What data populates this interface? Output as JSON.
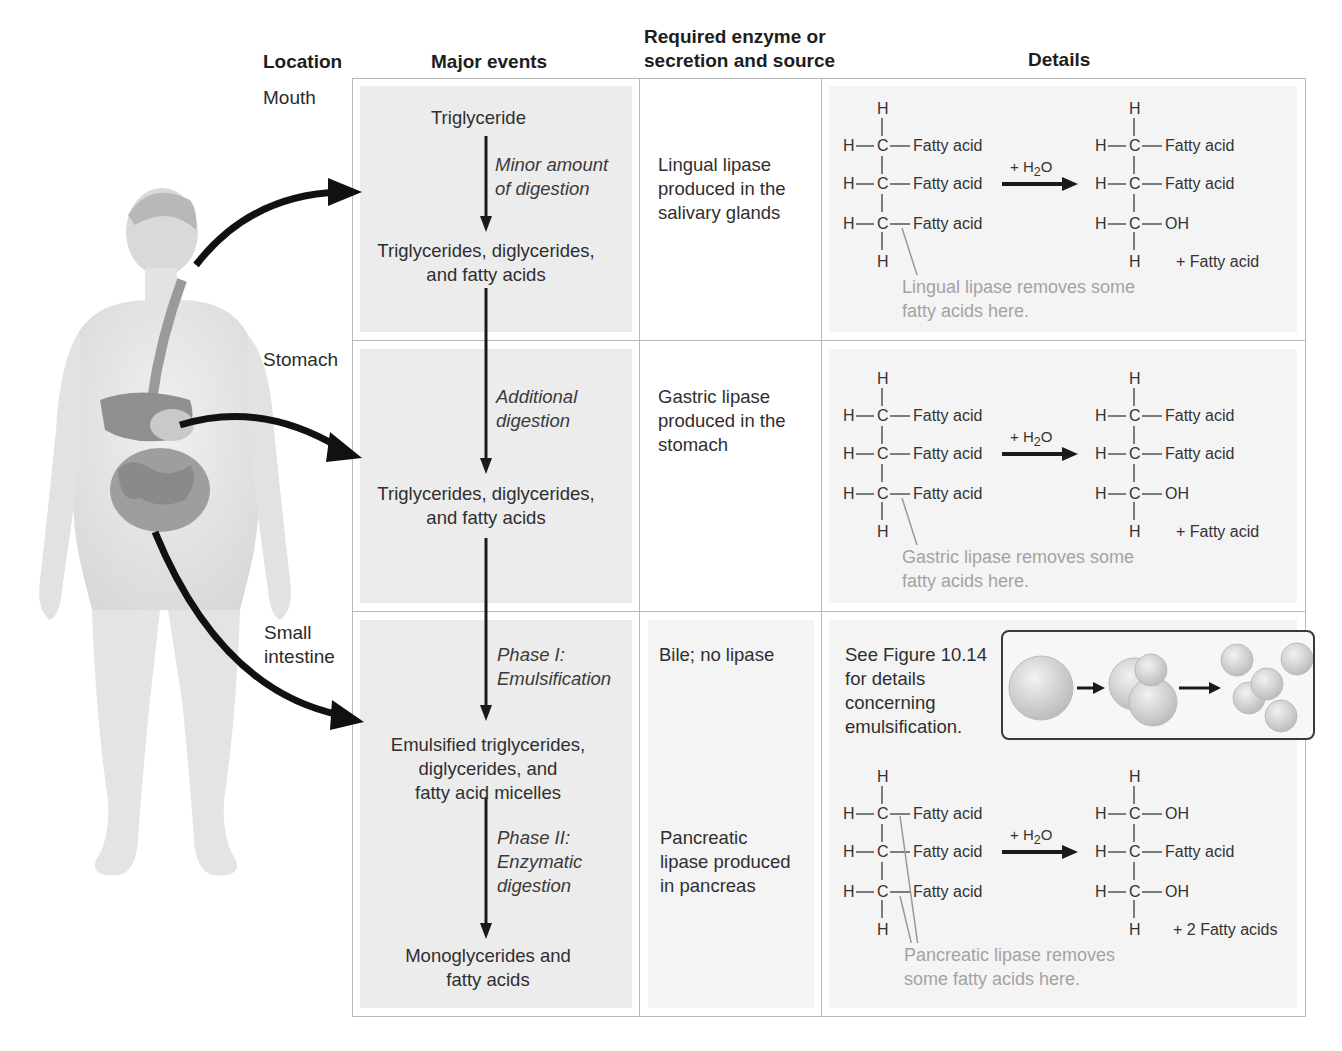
{
  "figure": {
    "headers": {
      "location": "Location",
      "major_events": "Major events",
      "enzyme_line1": "Required enzyme or",
      "enzyme_line2": "secretion and source",
      "details": "Details"
    },
    "rows": [
      {
        "location": "Mouth",
        "events": {
          "start": "Triglyceride",
          "process_line1": "Minor amount",
          "process_line2": "of digestion",
          "result_line1": "Triglycerides, diglycerides,",
          "result_line2": "and fatty acids"
        },
        "enzyme": [
          "Lingual lipase",
          "produced in the",
          "salivary glands"
        ],
        "reaction": {
          "reactant": [
            "Fatty acid",
            "Fatty acid",
            "Fatty acid"
          ],
          "reagent": "+ H",
          "reagent_sub": "2",
          "reagent_tail": "O",
          "product": [
            "Fatty acid",
            "Fatty acid",
            "OH"
          ],
          "byproduct": "+ Fatty acid",
          "note": [
            "Lingual lipase removes some",
            "fatty acids here."
          ]
        }
      },
      {
        "location": "Stomach",
        "events": {
          "process_line1": "Additional",
          "process_line2": "digestion",
          "result_line1": "Triglycerides, diglycerides,",
          "result_line2": "and fatty acids"
        },
        "enzyme": [
          "Gastric lipase",
          "produced in the",
          "stomach"
        ],
        "reaction": {
          "reactant": [
            "Fatty acid",
            "Fatty acid",
            "Fatty acid"
          ],
          "reagent": "+ H",
          "reagent_sub": "2",
          "reagent_tail": "O",
          "product": [
            "Fatty acid",
            "Fatty acid",
            "OH"
          ],
          "byproduct": "+ Fatty acid",
          "note": [
            "Gastric lipase removes some",
            "fatty acids here."
          ]
        }
      },
      {
        "location_line1": "Small",
        "location_line2": "intestine",
        "events": {
          "phase1_line1": "Phase I:",
          "phase1_line2": "Emulsification",
          "mid_line1": "Emulsified triglycerides,",
          "mid_line2": "diglycerides, and",
          "mid_line3": "fatty acid micelles",
          "phase2_line1": "Phase II:",
          "phase2_line2": "Enzymatic",
          "phase2_line3": "digestion",
          "result_line1": "Monoglycerides and",
          "result_line2": "fatty acids"
        },
        "enzyme_phase1": "Bile; no lipase",
        "enzyme_phase2": [
          "Pancreatic",
          "lipase produced",
          "in pancreas"
        ],
        "emulsification_ref": [
          "See Figure 10.14",
          "for details",
          "concerning",
          "emulsification."
        ],
        "reaction": {
          "reactant": [
            "Fatty acid",
            "Fatty acid",
            "Fatty acid"
          ],
          "reagent": "+ H",
          "reagent_sub": "2",
          "reagent_tail": "O",
          "product": [
            "OH",
            "Fatty acid",
            "OH"
          ],
          "byproduct": "+ 2 Fatty acids",
          "note": [
            "Pancreatic lipase removes",
            "some fatty acids here."
          ]
        }
      }
    ],
    "atoms": {
      "H": "H",
      "C": "C"
    },
    "colors": {
      "grid": "#b9b9b9",
      "panel": "#ececec",
      "arrow": "#1a1a1a",
      "note_text": "#a3a3a3"
    }
  }
}
